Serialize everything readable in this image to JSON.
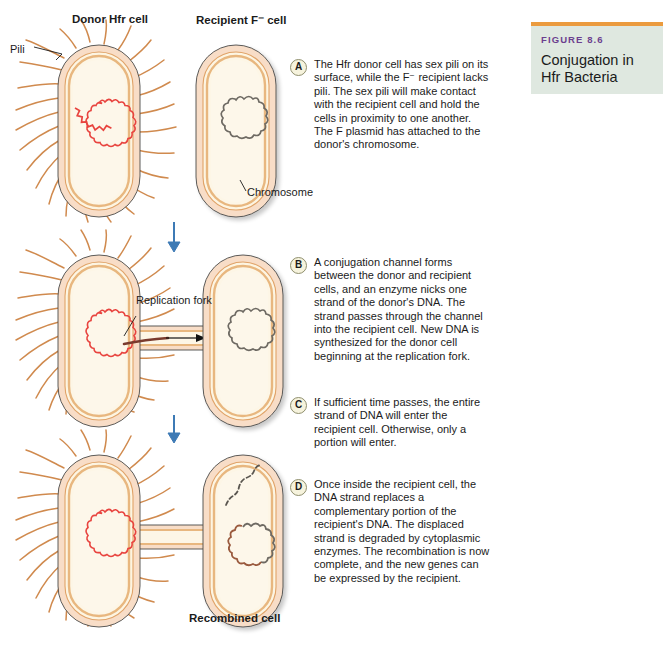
{
  "figure": {
    "number_label": "FIGURE 8.6",
    "title": "Conjugation in Hfr Bacteria",
    "accent_color": "#eb9b3e",
    "panel_bg": "#dfe8e0",
    "number_color": "#6c3f8f"
  },
  "headings": {
    "donor": "Donor Hfr cell",
    "recipient": "Recipient F⁻ cell"
  },
  "labels": {
    "pili": "Pili",
    "chromosome": "Chromosome",
    "replication_fork": "Replication fork",
    "recombined_cell": "Recombined cell"
  },
  "colors": {
    "cell_outer": "#f7dcc6",
    "cell_wall": "#e8a96a",
    "cytoplasm": "#fdf3dd",
    "pili": "#d08a4e",
    "plasmid_red": "#e8443f",
    "chromosome_gray": "#6e6a63",
    "arrow_blue": "#3d7ab5",
    "dna_strand_dark": "#7a3b2e"
  },
  "steps": [
    {
      "marker": "A",
      "text": "The Hfr donor cell has sex pili on its surface, while the F⁻ recipient lacks pili. The sex pili will make contact with the recipient cell and hold the cells in proximity to one another. The F plasmid has attached to the donor's chromosome."
    },
    {
      "marker": "B",
      "text": "A conjugation channel forms between the donor and recipient cells, and an enzyme nicks one strand of the donor's DNA. The strand passes through the channel into the recipient cell. New DNA is synthesized for the donor cell beginning at the replication fork."
    },
    {
      "marker": "C",
      "text": "If sufficient time passes, the entire strand of DNA will enter the recipient cell. Otherwise, only a portion will enter."
    },
    {
      "marker": "D",
      "text": "Once inside the recipient cell, the DNA strand replaces a complementary portion of the recipient's DNA. The displaced strand is degraded by cytoplasmic enzymes. The recombination is now complete, and the new genes can be expressed by the recipient."
    }
  ]
}
